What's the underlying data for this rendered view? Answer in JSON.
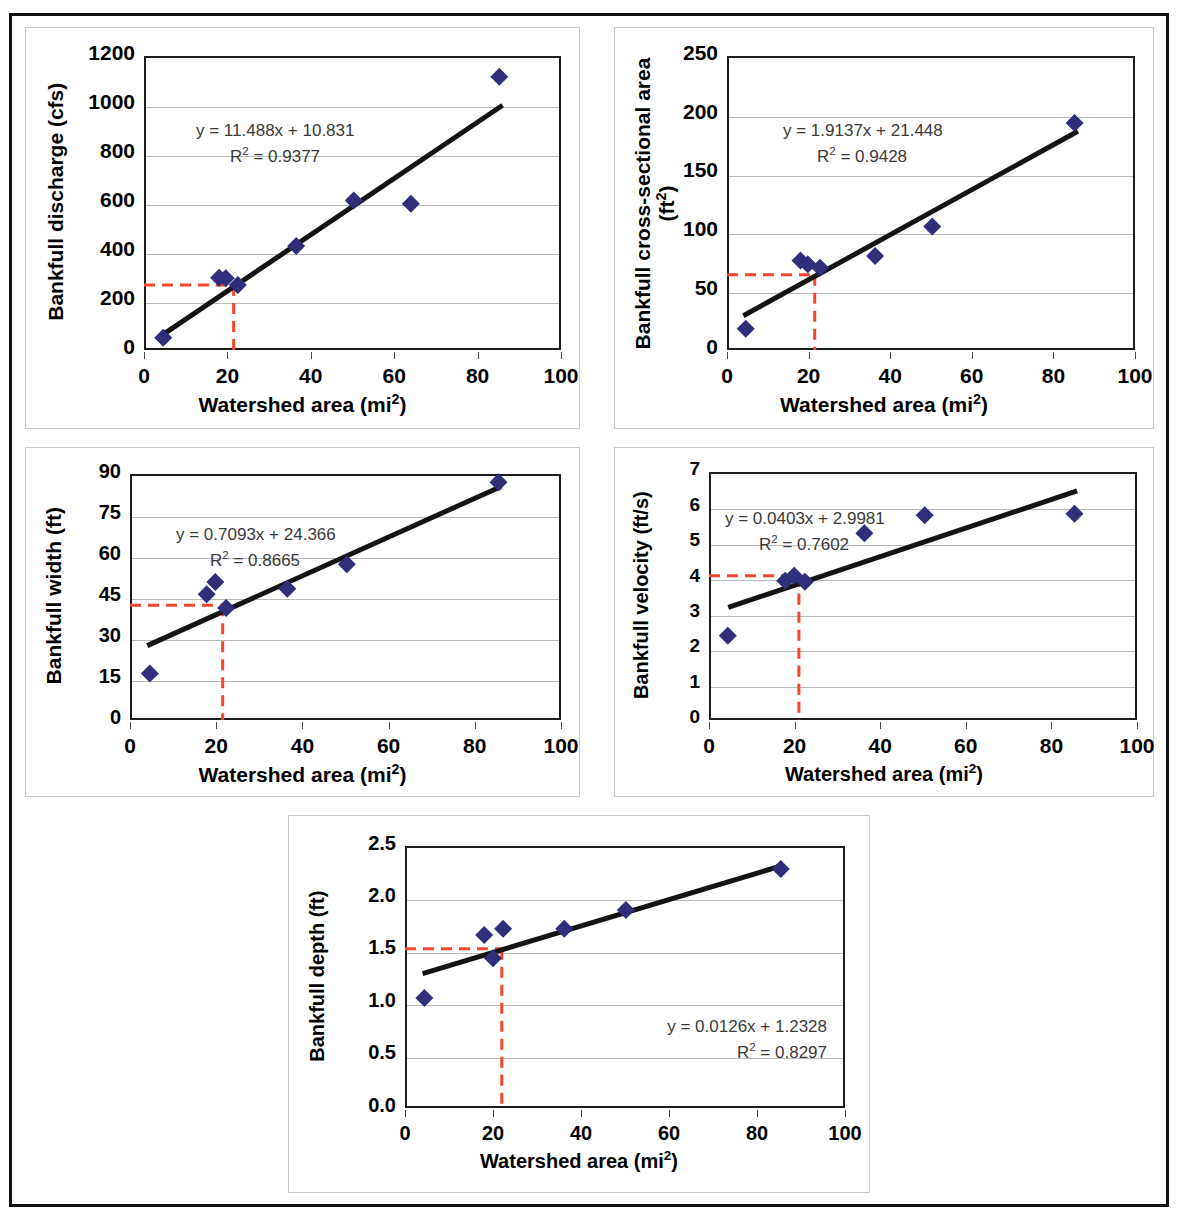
{
  "figure": {
    "marker_color": "#2e2e7a",
    "trend_color": "#141414",
    "guide_color": "#f4452e",
    "grid_color": "#b9b9b9",
    "axis_color": "#1d1d1d",
    "equation_color": "#3a3a3a",
    "frame_color": "#111111",
    "panel_border_color": "#c9c9c9"
  },
  "common": {
    "xlabel_prefix": "Watershed area (mi",
    "xlabel_sup": "2",
    "xlabel_suffix": ")",
    "x_ticks": [
      "0",
      "20",
      "40",
      "60",
      "80",
      "100"
    ],
    "xlim": [
      0,
      100
    ]
  },
  "chart_data": [
    {
      "id": "bankfull-discharge",
      "type": "scatter",
      "title": "",
      "ylabel": "Bankfull discharge (cfs)",
      "ylabel_lines": [
        "Bankfull discharge (cfs)"
      ],
      "xlabel": "Watershed area (mi2)",
      "equation": "y = 11.488x + 10.831",
      "r2_prefix": "R",
      "r2_sup": "2",
      "r2_value": " = 0.9377",
      "slope": 11.488,
      "intercept": 10.831,
      "r2": 0.9377,
      "x": [
        4.6,
        18.0,
        19.6,
        22.5,
        36.5,
        50.3,
        64.0,
        85.2
      ],
      "y": [
        50,
        295,
        293,
        265,
        425,
        610,
        597,
        1115
      ],
      "y_ticks": [
        "0",
        "200",
        "400",
        "600",
        "800",
        "1000",
        "1200"
      ],
      "ylim": [
        0,
        1200
      ],
      "guide_x": 21.5,
      "guide_y": 265,
      "trend_x_range": [
        4.0,
        86.0
      ],
      "grid": true,
      "legend": "none"
    },
    {
      "id": "bankfull-cross-sectional-area",
      "type": "scatter",
      "title": "",
      "ylabel": "Bankfull cross-sectional area (ft2)",
      "ylabel_lines": [
        "Bankfull cross-sectional area",
        "(ft2)"
      ],
      "xlabel": "Watershed area (mi2)",
      "equation": "y = 1.9137x + 21.448",
      "r2_prefix": "R",
      "r2_sup": "2",
      "r2_value": " = 0.9428",
      "slope": 1.9137,
      "intercept": 21.448,
      "r2": 0.9428,
      "x": [
        4.6,
        18.0,
        19.8,
        22.8,
        36.3,
        50.3,
        85.2
      ],
      "y": [
        18,
        76,
        73,
        70,
        80,
        105,
        193
      ],
      "y_ticks": [
        "0",
        "50",
        "100",
        "150",
        "200",
        "250"
      ],
      "ylim": [
        0,
        250
      ],
      "guide_x": 21.5,
      "guide_y": 64,
      "trend_x_range": [
        4.0,
        86.0
      ],
      "grid": true,
      "legend": "none"
    },
    {
      "id": "bankfull-width",
      "type": "scatter",
      "title": "",
      "ylabel": "Bankfull width (ft)",
      "ylabel_lines": [
        "Bankfull width (ft)"
      ],
      "xlabel": "Watershed area (mi2)",
      "equation": "y = 0.7093x + 24.366",
      "r2_prefix": "R",
      "r2_sup": "2",
      "r2_value": " = 0.8665",
      "slope": 0.7093,
      "intercept": 24.366,
      "r2": 0.8665,
      "x": [
        4.6,
        17.8,
        19.8,
        22.3,
        36.5,
        50.3,
        85.5
      ],
      "y": [
        17,
        46,
        50.5,
        41,
        48,
        57,
        87
      ],
      "y_ticks": [
        "0",
        "15",
        "30",
        "45",
        "60",
        "75",
        "90"
      ],
      "ylim": [
        0,
        90
      ],
      "guide_x": 21.5,
      "guide_y": 42,
      "trend_x_range": [
        4.0,
        86.0
      ],
      "grid": true,
      "legend": "none"
    },
    {
      "id": "bankfull-velocity",
      "type": "scatter",
      "title": "",
      "ylabel": "Bankfull velocity (ft/s)",
      "ylabel_lines": [
        "Bankfull velocity (ft/s)"
      ],
      "xlabel": "Watershed area (mi2)",
      "equation": "y = 0.0403x + 2.9981",
      "r2_prefix": "R",
      "r2_sup": "2",
      "r2_value": " = 0.7602",
      "slope": 0.0403,
      "intercept": 2.9981,
      "r2": 0.7602,
      "x": [
        4.4,
        17.8,
        19.9,
        22.4,
        36.3,
        50.4,
        85.4
      ],
      "y": [
        2.38,
        3.93,
        4.07,
        3.9,
        5.27,
        5.78,
        5.82
      ],
      "y_ticks": [
        "0",
        "1",
        "2",
        "3",
        "4",
        "5",
        "6",
        "7"
      ],
      "ylim": [
        0,
        7
      ],
      "guide_x": 21.0,
      "guide_y": 4.07,
      "trend_x_range": [
        4.5,
        86.0
      ],
      "grid": true,
      "legend": "none"
    },
    {
      "id": "bankfull-depth",
      "type": "scatter",
      "title": "",
      "ylabel": "Bankfull depth (ft)",
      "ylabel_lines": [
        "Bankfull depth (ft)"
      ],
      "xlabel": "Watershed area (mi2)",
      "equation": "y = 0.0126x + 1.2328",
      "r2_prefix": "R",
      "r2_sup": "2",
      "r2_value": " = 0.8297",
      "slope": 0.0126,
      "intercept": 1.2328,
      "r2": 0.8297,
      "x": [
        4.4,
        18.0,
        20.0,
        22.3,
        36.2,
        50.2,
        85.4
      ],
      "y": [
        1.05,
        1.65,
        1.43,
        1.71,
        1.71,
        1.89,
        2.28
      ],
      "y_ticks": [
        "0.0",
        "0.5",
        "1.0",
        "1.5",
        "2.0",
        "2.5"
      ],
      "ylim": [
        0,
        2.5
      ],
      "guide_x": 22.0,
      "guide_y": 1.52,
      "trend_x_range": [
        4.0,
        86.0
      ],
      "grid": true,
      "legend": "none"
    }
  ]
}
